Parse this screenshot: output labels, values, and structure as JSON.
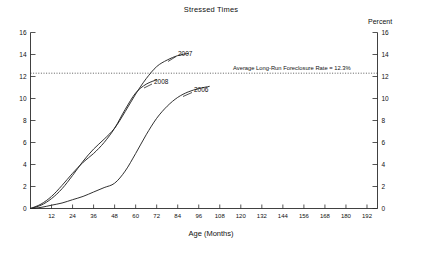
{
  "chart_data": {
    "type": "line",
    "title": "Stressed Times",
    "xlabel": "Age (Months)",
    "ylabel": "",
    "right_axis_label": "Percent",
    "xlim": [
      0,
      198
    ],
    "ylim": [
      0,
      16
    ],
    "xticks": [
      12,
      24,
      36,
      48,
      60,
      72,
      84,
      96,
      108,
      120,
      132,
      144,
      156,
      168,
      180,
      192
    ],
    "yticks": [
      0,
      2,
      4,
      6,
      8,
      10,
      12,
      14,
      16
    ],
    "right_yticks": [
      0,
      2,
      4,
      6,
      8,
      10,
      12,
      14,
      16
    ],
    "grid": false,
    "legend_position": "inline-labels",
    "annotations": [
      {
        "name": "average-long-run-foreclosure-rate",
        "text": "Average Long-Run Foreclosure Rate = 12.3%",
        "value": 12.3,
        "style": "dotted-horizontal-line"
      }
    ],
    "series": [
      {
        "name": "2006",
        "label": "2006",
        "x": [
          0,
          6,
          12,
          18,
          24,
          30,
          36,
          42,
          48,
          54,
          60,
          66,
          72,
          78,
          84,
          90,
          96,
          102
        ],
        "values": [
          0.0,
          0.1,
          0.3,
          0.5,
          0.8,
          1.1,
          1.5,
          1.9,
          2.3,
          3.4,
          5.0,
          6.7,
          8.2,
          9.3,
          10.1,
          10.6,
          10.9,
          11.1
        ]
      },
      {
        "name": "2007",
        "label": "2007",
        "x": [
          0,
          6,
          12,
          18,
          24,
          30,
          36,
          42,
          48,
          54,
          60,
          66,
          72,
          78,
          84,
          90
        ],
        "values": [
          0.0,
          0.3,
          0.9,
          1.8,
          3.0,
          4.3,
          5.4,
          6.3,
          7.3,
          8.8,
          10.4,
          11.8,
          12.9,
          13.5,
          13.9,
          14.1
        ]
      },
      {
        "name": "2008",
        "label": "2008",
        "x": [
          0,
          6,
          12,
          18,
          24,
          30,
          36,
          42,
          48,
          54,
          60,
          66,
          72
        ],
        "values": [
          0.0,
          0.4,
          1.1,
          2.1,
          3.2,
          4.2,
          5.0,
          6.0,
          7.3,
          9.0,
          10.5,
          11.3,
          11.7
        ]
      }
    ]
  },
  "colors": {
    "line": "#262626",
    "axis": "#2b2b2b",
    "background": "#ffffff"
  }
}
